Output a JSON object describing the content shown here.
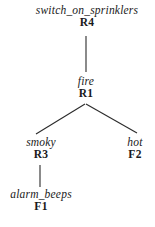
{
  "diagram": {
    "background_color": "#ffffff",
    "line_color": "#2b2b2b",
    "text_color": "#1a1a1a",
    "nodes": [
      {
        "id": "root",
        "proposition": "switch_on_sprinklers",
        "rule": "R4"
      },
      {
        "id": "fire",
        "proposition": "fire",
        "rule": "R1"
      },
      {
        "id": "smoky",
        "proposition": "smoky",
        "rule": "R3"
      },
      {
        "id": "hot",
        "proposition": "hot",
        "rule": "F2"
      },
      {
        "id": "alarm_beeps",
        "proposition": "alarm_beeps",
        "rule": "F1"
      }
    ],
    "edges": [
      {
        "id": "edge-root-fire",
        "from": "root",
        "to": "fire",
        "kind": "vertical"
      },
      {
        "id": "edge-fire-smoky",
        "from": "fire",
        "to": "smoky",
        "kind": "diagonal-left"
      },
      {
        "id": "edge-fire-hot",
        "from": "fire",
        "to": "hot",
        "kind": "diagonal-right"
      },
      {
        "id": "edge-smoky-alarm-beeps",
        "from": "smoky",
        "to": "alarm_beeps",
        "kind": "vertical"
      }
    ]
  }
}
